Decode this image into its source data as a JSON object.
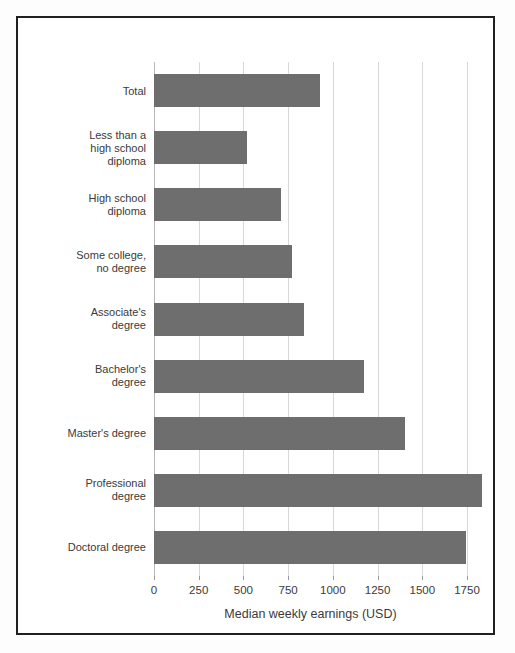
{
  "chart_data": {
    "type": "bar",
    "orientation": "horizontal",
    "title": "",
    "subtitle": "",
    "xlabel": "Median weekly earnings (USD)",
    "ylabel": "",
    "categories": [
      "Total",
      "Less than a\nhigh school\ndiploma",
      "High school\ndiploma",
      "Some college,\nno degree",
      "Associate's\ndegree",
      "Bachelor's\ndegree",
      "Master's degree",
      "Professional\ndegree",
      "Doctoral degree"
    ],
    "values": [
      930,
      520,
      712,
      774,
      836,
      1173,
      1401,
      1836,
      1743
    ],
    "xticks": [
      0,
      250,
      500,
      750,
      1000,
      1250,
      1500,
      1750
    ],
    "xtick_labels": [
      "0",
      "250",
      "500",
      "750",
      "1000",
      "1250",
      "1500",
      "1750"
    ],
    "xlim": [
      0,
      1750
    ],
    "grid": true,
    "grid_axis": "x",
    "legend": false,
    "legend_position": "none",
    "bar_color": "#6e6e6e",
    "grid_color": "#d8d8d8",
    "frame_color": "#221f1f",
    "background_color": "#ffffff",
    "text_color": "#3a3a3a"
  }
}
